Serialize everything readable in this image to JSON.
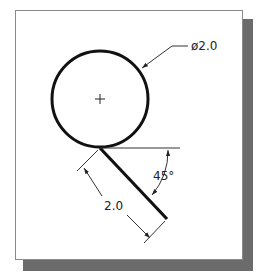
{
  "drawing": {
    "diameter_label": "ø2.0",
    "length_label": "2.0",
    "angle_label": "45°",
    "colors": {
      "line": "#111111",
      "thin_line": "#333333",
      "frame_border": "#8a8a8a",
      "shadow": "#6b6b6b",
      "background": "#ffffff"
    }
  }
}
